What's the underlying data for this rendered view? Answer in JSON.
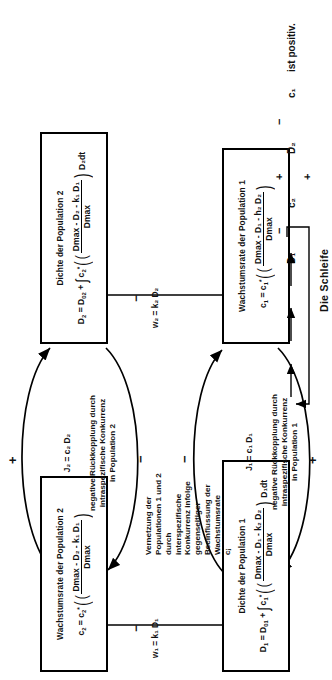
{
  "diagram": {
    "title_note": "Die Schleife",
    "boxes": [
      {
        "id": "growth-rate-pop2",
        "title": "Wachstumsrate der Population 2",
        "eq_lhs": "c",
        "eq_lhs_sub": "2",
        "eq_rhs": "c",
        "eq_rhs_sub": "2",
        "eq_rhs_sup": "*",
        "num": "Dmax - D₂ - k₁ D₁",
        "den": "Dmax",
        "tail": ""
      },
      {
        "id": "density-pop2",
        "title": "Dichte der Population 2",
        "eq_text": "D₂ = D₀₂ + ∫ c₂* ( (Dmax - D₂ - k₁ D₁) / Dmax ) D₂dt",
        "num": "Dmax - D₂ - k₁ D₁",
        "den": "Dmax",
        "tail": "D₂dt"
      },
      {
        "id": "density-pop1",
        "title": "Dichte der Population 1",
        "eq_text": "D₁ = D₀₁ + ∫ c₁* ( (Dmax - D₁ - k₂ D₂) / Dmax ) D₁dt",
        "num": "Dmax - D₁ - k₂ D₂",
        "den": "Dmax",
        "tail": "D₁dt"
      },
      {
        "id": "growth-rate-pop1",
        "title": "Wachstumsrate der Population 1",
        "eq_text": "c₁ = c₁* ( (Dmax - D₁ - h₂ D₂) / Dmax )",
        "num": "Dmax - D₁ - h₂ D₂",
        "den": "Dmax",
        "tail": ""
      }
    ],
    "loops": [
      {
        "id": "loop-pop2",
        "equation": "J₂ = c₂ D₂",
        "caption": "negative Rückkopplung durch\nintraspezifische Konkurrenz\nin Population 2",
        "sign_top": "+",
        "sign_bottom": "−"
      },
      {
        "id": "loop-pop1",
        "equation": "J₁ = c₁ D₁",
        "caption": "negative Rückkopplung  durch\nintraspezifische  Konkurrenz\nin Population 1",
        "sign_top": "−",
        "sign_bottom": "+"
      }
    ],
    "coupling_text": "Vernetzung der\nPopulationen 1 und 2\ndurch\ninterspezifische\nKonkurrenz infolge\ngegenseitiger\nBeeinflussung  der\nWachstumsrate\ncⱼ",
    "cross_arrows": [
      {
        "id": "w1",
        "label": "w₁ = k₁ D₁",
        "sign": "−"
      },
      {
        "id": "w2",
        "label": "w₂ = k₂ D₂",
        "sign": "−"
      }
    ],
    "schleife": {
      "caption": "Die Schleife",
      "nodes": [
        "D₁",
        "c₂",
        "D₂",
        "c₁"
      ],
      "signs": [
        "−",
        "+",
        "−",
        "+"
      ],
      "conclusion": "ist positiv."
    }
  },
  "colors": {
    "ink": "#111111",
    "paper": "#ffffff"
  }
}
